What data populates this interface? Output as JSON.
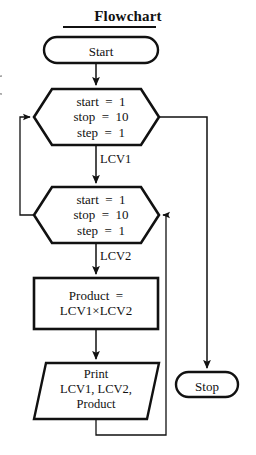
{
  "figure": {
    "title": "Flowchart",
    "title_underline": true,
    "background": "#ffffff",
    "stroke": "#111111",
    "width": 256,
    "height": 455
  },
  "nodes": {
    "start": {
      "label": "Start",
      "shape": "terminator",
      "x": 43,
      "y": 36,
      "w": 116,
      "h": 28
    },
    "loop_outer": {
      "shape": "hexagon-loop",
      "name": "loop-outer-lcv1",
      "lines": [
        "start  =  1",
        "stop  =  10",
        "step  =  1"
      ],
      "text": "start  =  1\nstop  =  10\nstep  =  1",
      "x": 33,
      "y": 88,
      "w": 127,
      "h": 58
    },
    "loop_inner": {
      "shape": "hexagon-loop",
      "name": "loop-inner-lcv2",
      "lines": [
        "start  =  1",
        "stop  =  10",
        "step  =  1"
      ],
      "text": "start  =  1\nstop  =  10\nstep  =  1",
      "x": 33,
      "y": 186,
      "w": 127,
      "h": 58
    },
    "product": {
      "shape": "process",
      "lines": [
        "Product  =",
        "LCV1×LCV2"
      ],
      "text": "Product  =\nLCV1×LCV2",
      "x": 33,
      "y": 277,
      "w": 126,
      "h": 53
    },
    "print": {
      "shape": "input-output",
      "lines": [
        "Print",
        "LCV1, LCV2,",
        "Product"
      ],
      "text": "Print\nLCV1, LCV2,\nProduct",
      "x": 33,
      "y": 362,
      "w": 127,
      "h": 58
    },
    "stop": {
      "label": "Stop",
      "shape": "terminator",
      "x": 175,
      "y": 371,
      "w": 64,
      "h": 26
    }
  },
  "edge_labels": {
    "lcv1": "LCV1",
    "lcv2": "LCV2"
  },
  "connectors": [
    {
      "name": "start-to-loop-outer",
      "from": "start",
      "to": "loop_outer",
      "arrow": true
    },
    {
      "name": "loop-outer-to-loop-inner",
      "from": "loop_outer",
      "to": "loop_inner",
      "label": "LCV1",
      "arrow": true
    },
    {
      "name": "loop-inner-to-product",
      "from": "loop_inner",
      "to": "product",
      "label": "LCV2",
      "arrow": true
    },
    {
      "name": "product-to-print",
      "from": "product",
      "to": "print",
      "arrow": true
    },
    {
      "name": "loop-outer-exit-to-stop",
      "from": "loop_outer",
      "to": "stop",
      "arrow": true
    },
    {
      "name": "loop-inner-back-to-loop-outer",
      "from": "loop_inner",
      "to": "loop_outer",
      "arrow": true
    },
    {
      "name": "print-back-to-loop-inner",
      "from": "print",
      "to": "loop_inner",
      "arrow": true
    }
  ]
}
